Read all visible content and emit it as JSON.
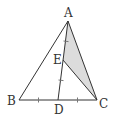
{
  "diagram": {
    "type": "geometry-triangle",
    "points": {
      "A": {
        "label": "A"
      },
      "B": {
        "label": "B"
      },
      "C": {
        "label": "C"
      },
      "D": {
        "label": "D"
      },
      "E": {
        "label": "E"
      }
    },
    "segments": [
      "AB",
      "BC",
      "CA",
      "AD",
      "EC"
    ],
    "shaded_region": "triangle AEC",
    "equal_marks": [
      {
        "group": 1,
        "segments": [
          "AE",
          "ED"
        ]
      },
      {
        "group": 2,
        "segments": [
          "BD",
          "DC"
        ]
      }
    ],
    "colors": {
      "stroke": "#333333",
      "shade": "#dcdcdc"
    }
  }
}
